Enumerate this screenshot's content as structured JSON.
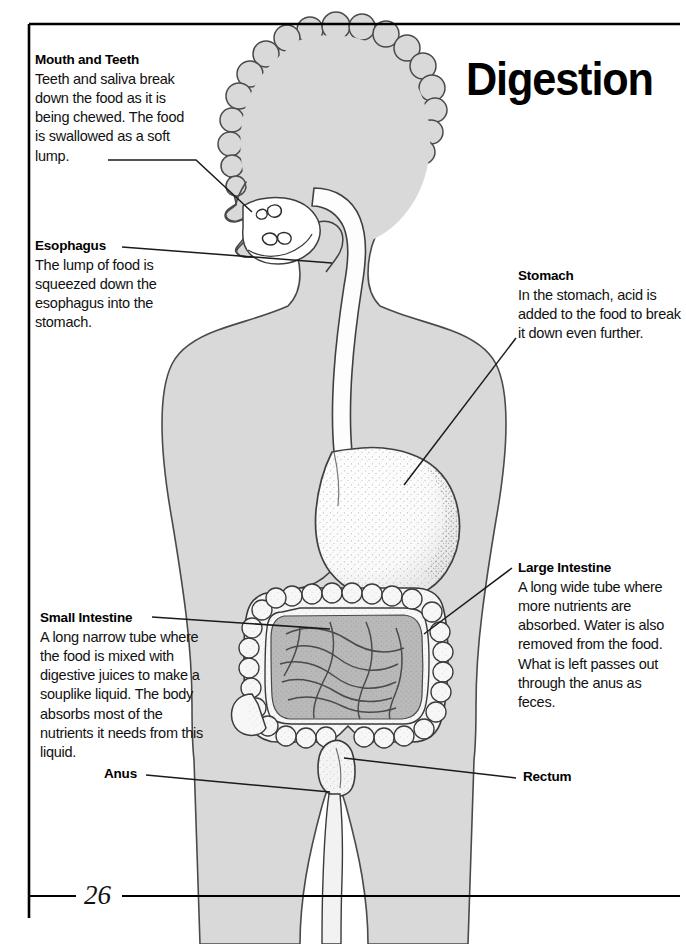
{
  "page": {
    "title": "Digestion",
    "number": "26"
  },
  "callouts": [
    {
      "id": "mouth-and-teeth",
      "heading": "Mouth and Teeth",
      "body": "Teeth and saliva break down the food as it is being chewed. The food is swallowed as a soft lump."
    },
    {
      "id": "esophagus",
      "heading": "Esophagus",
      "body": "The lump of food is squeezed down the esophagus into the stomach."
    },
    {
      "id": "stomach",
      "heading": "Stomach",
      "body": "In the stomach, acid is added to the food to break it down even further."
    },
    {
      "id": "large-intestine",
      "heading": "Large Intestine",
      "body": "A long wide tube where more nutrients are absorbed. Water is also removed from the food. What is left passes out through the anus as feces."
    },
    {
      "id": "small-intestine",
      "heading": "Small Intestine",
      "body": "A long narrow tube where the food is mixed with digestive juices to make a souplike liquid. The body absorbs most of the nutrients it needs from this liquid."
    }
  ],
  "simple_labels": [
    {
      "id": "anus",
      "text": "Anus"
    },
    {
      "id": "rectum",
      "text": "Rectum"
    }
  ],
  "figure": {
    "caption": "Cutaway side view of a child's body showing the digestive tract",
    "organs": [
      "mouth",
      "teeth",
      "esophagus",
      "stomach",
      "small-intestine",
      "large-intestine",
      "rectum",
      "anus"
    ]
  },
  "colors": {
    "body_fill": "#d9d9d9",
    "body_stroke": "#3a3a3a",
    "organ_fill": "#fbfbfb",
    "small_intestine_fill": "#b9b9b9",
    "leader_line": "#1a1a1a",
    "border": "#000000",
    "text": "#111111"
  }
}
